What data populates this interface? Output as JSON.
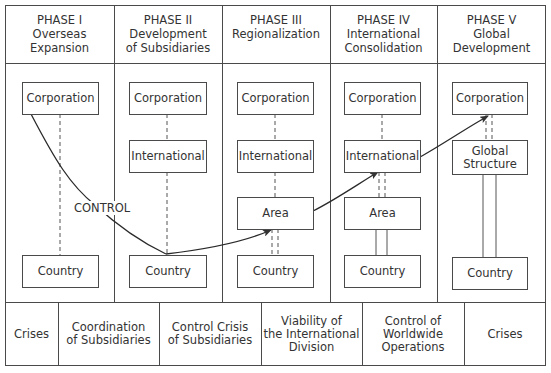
{
  "phases": [
    {
      "title": "PHASE I",
      "subtitle_lines": [
        "Overseas",
        "Expansion"
      ]
    },
    {
      "title": "PHASE II",
      "subtitle_lines": [
        "Development",
        "of Subsidiaries"
      ]
    },
    {
      "title": "PHASE III",
      "subtitle_lines": [
        "Regionalization"
      ]
    },
    {
      "title": "PHASE IV",
      "subtitle_lines": [
        "International",
        "Consolidation"
      ]
    },
    {
      "title": "PHASE V",
      "subtitle_lines": [
        "Global",
        "Development"
      ]
    }
  ],
  "nodes": {
    "corporation": "Corporation",
    "international": "International",
    "area": "Area",
    "country": "Country",
    "global_structure_lines": [
      "Global",
      "Structure"
    ]
  },
  "control_label": "CONTROL",
  "crises": [
    {
      "lines": [
        "Crises"
      ]
    },
    {
      "lines": [
        "Coordination",
        "of Subsidiaries"
      ]
    },
    {
      "lines": [
        "Control Crisis",
        "of Subsidiaries"
      ]
    },
    {
      "lines": [
        "Viability of",
        "the International",
        "Division"
      ]
    },
    {
      "lines": [
        "Control of",
        "Worldwide",
        "Operations"
      ]
    },
    {
      "lines": [
        "Crises"
      ]
    }
  ],
  "colors": {
    "line": "#4a4a4a",
    "text": "#333333",
    "background": "#ffffff"
  }
}
